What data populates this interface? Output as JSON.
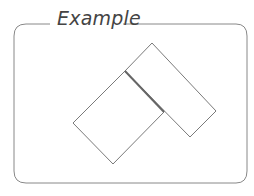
{
  "figure": {
    "title": "Example",
    "colors": {
      "stroke": "#7a7a7a",
      "shared_edge": "#666666",
      "frame": "#888888",
      "background": "#ffffff"
    }
  },
  "shapes": {
    "left_rectangle": {
      "points": [
        [
          125,
          71
        ],
        [
          164,
          112
        ],
        [
          113,
          164
        ],
        [
          73,
          123
        ]
      ]
    },
    "right_rectangle": {
      "points": [
        [
          152,
          43
        ],
        [
          216,
          111
        ],
        [
          190,
          137
        ],
        [
          125,
          71
        ]
      ]
    },
    "shared_edge": {
      "from": [
        125,
        71
      ],
      "to": [
        164,
        112
      ]
    }
  }
}
